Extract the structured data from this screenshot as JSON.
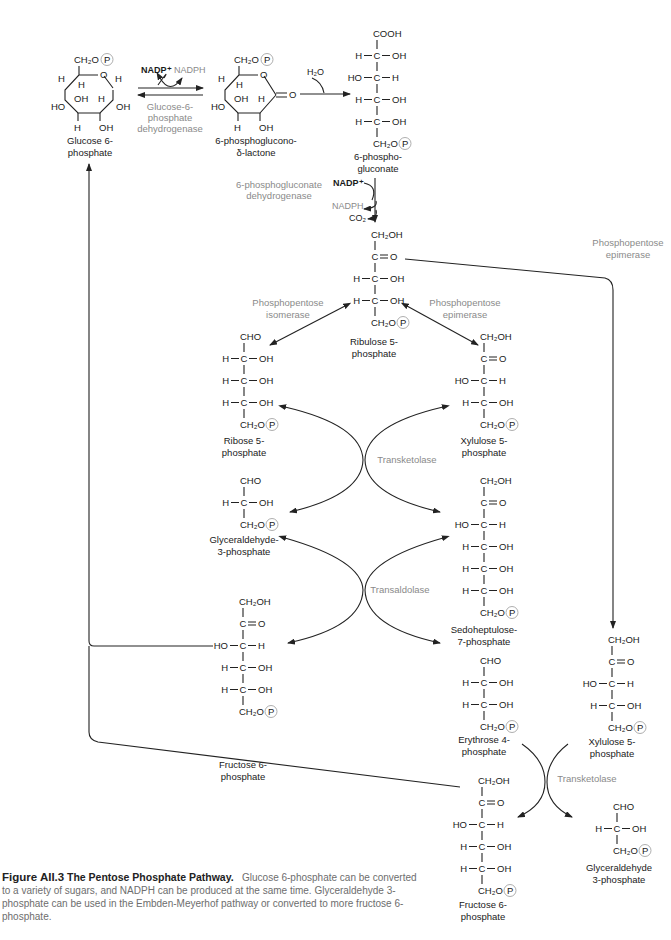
{
  "molecules": {
    "glucose6p": {
      "name1": "Glucose 6-",
      "name2": "phosphate"
    },
    "lactone": {
      "name1": "6-phosphoglucono-",
      "name2": "δ-lactone"
    },
    "gluconate": {
      "name1": "6-phospho-",
      "name2": "gluconate",
      "rows": [
        "COOH",
        "H—C—OH",
        "HO—C—H",
        "H—C—OH",
        "H—C—OH",
        "CH₂O"
      ]
    },
    "ribulose5p": {
      "name1": "Ribulose 5-",
      "name2": "phosphate",
      "rows": [
        "CH₂OH",
        "C═O",
        "H—C—OH",
        "H—C—OH",
        "CH₂O"
      ]
    },
    "ribose5p": {
      "name1": "Ribose 5-",
      "name2": "phosphate",
      "rows": [
        "CHO",
        "H—C—OH",
        "H—C—OH",
        "H—C—OH",
        "CH₂O"
      ]
    },
    "xylulose5p_a": {
      "name1": "Xylulose 5-",
      "name2": "phosphate",
      "rows": [
        "CH₂OH",
        "C═O",
        "HO—C—H",
        "H—C—OH",
        "CH₂O"
      ]
    },
    "g3p_a": {
      "name1": "Glyceraldehyde-",
      "name2": "3-phosphate",
      "rows": [
        "CHO",
        "H—C—OH",
        "CH₂O"
      ]
    },
    "sedoheptulose7p": {
      "name1": "Sedoheptulose-",
      "name2": "7-phosphate",
      "rows": [
        "CH₂OH",
        "C═O",
        "HO—C—H",
        "H—C—OH",
        "H—C—OH",
        "H—C—OH",
        "CH₂O"
      ]
    },
    "fructose6p_a": {
      "name1": "Fructose 6-",
      "name2": "phosphate",
      "rows": [
        "CH₂OH",
        "C═O",
        "HO—C—H",
        "H—C—OH",
        "H—C—OH",
        "CH₂O"
      ]
    },
    "erythrose4p": {
      "name1": "Erythrose 4-",
      "name2": "phosphate",
      "rows": [
        "CHO",
        "H—C—OH",
        "H—C—OH",
        "CH₂O"
      ]
    },
    "xylulose5p_b": {
      "name1": "Xylulose 5-",
      "name2": "phosphate",
      "rows": [
        "CH₂OH",
        "C═O",
        "HO—C—H",
        "H—C—OH",
        "CH₂O"
      ]
    },
    "fructose6p_b": {
      "name1": "Fructose 6-",
      "name2": "phosphate",
      "rows": [
        "CH₂OH",
        "C═O",
        "HO—C—H",
        "H—C—OH",
        "H—C—OH",
        "CH₂O"
      ]
    },
    "g3p_b": {
      "name1": "Glyceraldehyde",
      "name2": "3-phosphate",
      "rows": [
        "CHO",
        "H—C—OH",
        "CH₂O"
      ]
    }
  },
  "ring": {
    "ch2op": "CH₂O",
    "o": "O",
    "h": "H",
    "oh": "OH",
    "ho": "HO",
    "p": "P",
    "eq_o": "═O"
  },
  "enzymes": {
    "g6pdh": [
      "Glucose-6-",
      "phosphate",
      "dehydrogenase"
    ],
    "pgdh": [
      "6-phosphogluconate",
      "dehydrogenase"
    ],
    "isomerase": [
      "Phosphopentose",
      "isomerase"
    ],
    "epimerase_a": [
      "Phosphopentose",
      "epimerase"
    ],
    "epimerase_b": [
      "Phosphopentose",
      "epimerase"
    ],
    "transketolase_a": "Transketolase",
    "transaldolase": "Transaldolase",
    "transketolase_b": "Transketolase"
  },
  "cofactors": {
    "nadp_1": "NADP⁺",
    "nadph_1": "NADPH",
    "h2o": "H₂O",
    "nadp_2": "NADP⁺",
    "nadph_2": "NADPH",
    "co2": "CO₂"
  },
  "caption": {
    "figure": "Figure AII.3",
    "title": "The Pentose Phosphate Pathway.",
    "text": "Glucose 6-phosphate can be converted to a variety of sugars, and NADPH can be produced at the same time. Glyceraldehyde 3-phosphate can be used in the Embden-Meyerhof pathway or converted to more fructose 6-phosphate."
  },
  "colors": {
    "ink": "#1a1a1a",
    "enzyme": "#8a8a8a",
    "caption": "#6d6d6d"
  }
}
